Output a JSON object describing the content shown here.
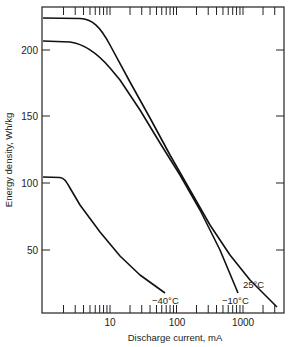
{
  "chart_data": {
    "type": "line",
    "title": "",
    "xlabel": "Discharge current, mA",
    "ylabel": "Energy density, Wh/kg",
    "xscale": "log",
    "xlim": [
      1,
      3500
    ],
    "ylim": [
      3,
      230
    ],
    "x_tick_labels": [
      "10",
      "100",
      "1000"
    ],
    "y_tick_labels": [
      "50",
      "100",
      "150",
      "200"
    ],
    "grid": false,
    "series": [
      {
        "name": "25°C",
        "x": [
          1,
          2,
          3,
          5,
          10,
          20,
          50,
          100,
          200,
          500,
          1000,
          2000,
          3200
        ],
        "y": [
          225,
          224,
          218,
          195,
          175,
          155,
          128,
          108,
          90,
          65,
          48,
          30,
          7
        ]
      },
      {
        "name": "-10°C",
        "x": [
          1,
          2,
          3,
          5,
          10,
          20,
          50,
          100,
          200,
          500,
          830
        ],
        "y": [
          186,
          184,
          178,
          165,
          148,
          130,
          105,
          88,
          70,
          42,
          18
        ]
      },
      {
        "name": "-40°C",
        "x": [
          1,
          1.8,
          2.5,
          4,
          8,
          15,
          30,
          67
        ],
        "y": [
          104,
          103,
          98,
          86,
          68,
          52,
          38,
          18
        ]
      }
    ]
  },
  "labels": {
    "x_axis": "Discharge current, mA",
    "y_axis": "Energy density, Wh/kg",
    "series_25": "25°C",
    "series_m10": "−10°C",
    "series_m40": "−40°C",
    "xt10": "10",
    "xt100": "100",
    "xt1000": "1000",
    "yt50": "50",
    "yt100": "100",
    "yt150": "150",
    "yt200": "200"
  }
}
